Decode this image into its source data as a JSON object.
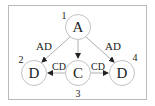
{
  "diagram": {
    "nodes": [
      {
        "id": "1",
        "label": "A",
        "index_label": "1"
      },
      {
        "id": "2",
        "label": "D",
        "index_label": "2"
      },
      {
        "id": "3",
        "label": "C",
        "index_label": "3"
      },
      {
        "id": "4",
        "label": "D",
        "index_label": "4"
      }
    ],
    "edges": [
      {
        "from": "1",
        "to": "2",
        "label": "AD"
      },
      {
        "from": "1",
        "to": "3",
        "label": ""
      },
      {
        "from": "1",
        "to": "4",
        "label": "AD"
      },
      {
        "from": "3",
        "to": "2",
        "label": "CD"
      },
      {
        "from": "3",
        "to": "4",
        "label": "CD"
      }
    ]
  }
}
